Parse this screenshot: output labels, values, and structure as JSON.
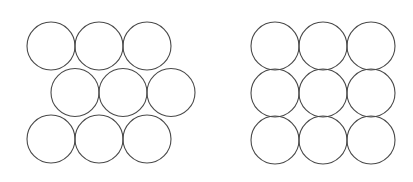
{
  "document": {
    "title": "Circle Packing Comparison",
    "background_color": "#ffffff",
    "width": 413,
    "height": 182
  },
  "style": {
    "stroke_color": "#4a4a4a",
    "stroke_width": 1.1,
    "fill_color": "none",
    "circle_radius": 24,
    "circle_diameter": 48
  },
  "figures": [
    {
      "id": "hexagonal-packing",
      "name": "hexagonal-close-packing-figure",
      "arrangement": "hexagonal",
      "circle_count": 9,
      "rows": 3,
      "columns": 3,
      "row_offset_x": 24,
      "row_spacing_y": 46.5,
      "column_spacing_x": 48,
      "origin_x": 51,
      "origin_y": 46,
      "circles": [
        {
          "cx": 51,
          "cy": 46,
          "r": 24,
          "row": 0,
          "col": 0
        },
        {
          "cx": 99,
          "cy": 46,
          "r": 24,
          "row": 0,
          "col": 1
        },
        {
          "cx": 147,
          "cy": 46,
          "r": 24,
          "row": 0,
          "col": 2
        },
        {
          "cx": 75,
          "cy": 92.5,
          "r": 24,
          "row": 1,
          "col": 0
        },
        {
          "cx": 123,
          "cy": 92.5,
          "r": 24,
          "row": 1,
          "col": 1
        },
        {
          "cx": 171,
          "cy": 92.5,
          "r": 24,
          "row": 1,
          "col": 2
        },
        {
          "cx": 51,
          "cy": 139,
          "r": 24,
          "row": 2,
          "col": 0
        },
        {
          "cx": 99,
          "cy": 139,
          "r": 24,
          "row": 2,
          "col": 1
        },
        {
          "cx": 147,
          "cy": 139,
          "r": 24,
          "row": 2,
          "col": 2
        }
      ]
    },
    {
      "id": "square-packing",
      "name": "square-packing-figure",
      "arrangement": "square",
      "circle_count": 9,
      "rows": 3,
      "columns": 3,
      "row_offset_x": 0,
      "row_spacing_y": 47,
      "column_spacing_x": 48,
      "origin_x": 275,
      "origin_y": 46,
      "circles": [
        {
          "cx": 275,
          "cy": 46,
          "r": 24,
          "row": 0,
          "col": 0
        },
        {
          "cx": 323,
          "cy": 46,
          "r": 24,
          "row": 0,
          "col": 1
        },
        {
          "cx": 371,
          "cy": 46,
          "r": 24,
          "row": 0,
          "col": 2
        },
        {
          "cx": 275,
          "cy": 93,
          "r": 24,
          "row": 1,
          "col": 0
        },
        {
          "cx": 323,
          "cy": 93,
          "r": 24,
          "row": 1,
          "col": 1
        },
        {
          "cx": 371,
          "cy": 93,
          "r": 24,
          "row": 1,
          "col": 2
        },
        {
          "cx": 275,
          "cy": 140,
          "r": 24,
          "row": 2,
          "col": 0
        },
        {
          "cx": 323,
          "cy": 140,
          "r": 24,
          "row": 2,
          "col": 1
        },
        {
          "cx": 371,
          "cy": 140,
          "r": 24,
          "row": 2,
          "col": 2
        }
      ]
    }
  ]
}
